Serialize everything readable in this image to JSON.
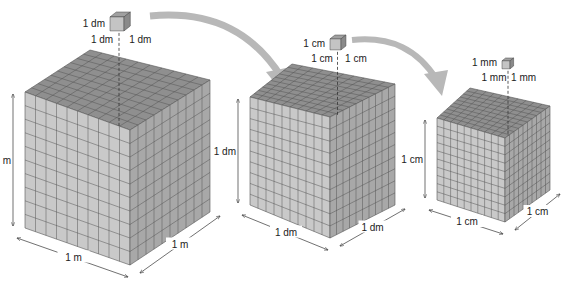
{
  "diagram": {
    "colors": {
      "top_face": "#8f8f8f",
      "front_face": "#c9c9c9",
      "right_face": "#a8a8a8",
      "grid_line": "#555555",
      "arrow": "#b8b8b8",
      "text": "#222222"
    },
    "cubes": [
      {
        "name": "meter-cube",
        "height_label": "1 m",
        "width_label": "1 m",
        "depth_label": "1 m",
        "small_cube": {
          "height_label": "1 dm",
          "width_label": "1 dm",
          "depth_label": "1 dm"
        }
      },
      {
        "name": "decimeter-cube",
        "height_label": "1 dm",
        "width_label": "1 dm",
        "depth_label": "1 dm",
        "small_cube": {
          "height_label": "1 cm",
          "width_label": "1 cm",
          "depth_label": "1 cm"
        }
      },
      {
        "name": "centimeter-cube",
        "height_label": "1 cm",
        "width_label": "1 cm",
        "depth_label": "1 cm",
        "small_cube": {
          "height_label": "1 mm",
          "width_label": "1 mm",
          "depth_label": "1 mm"
        }
      }
    ],
    "grid_divisions": 10
  }
}
